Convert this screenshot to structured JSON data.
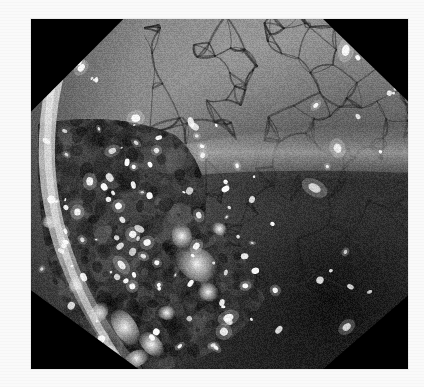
{
  "page": {
    "background_color": "#fafafa",
    "width": 424,
    "height": 387
  },
  "figure": {
    "name": "endoscopic-photograph",
    "alt_text": "Grayscale endoscopic photograph of mucosa with an irregular ulcerated nodular lesion on the left and a reticular vascular pattern on the right",
    "modality": "endoscopy",
    "color_mode": "grayscale",
    "frame": {
      "x": 31,
      "y": 19,
      "width": 377,
      "height": 350,
      "border_color": "#0a0a0a"
    },
    "corner_masks": [
      {
        "name": "top-left-mask",
        "corner": "top-left",
        "color": "#050505"
      },
      {
        "name": "top-right-mask",
        "corner": "top-right",
        "color": "#050505"
      },
      {
        "name": "bottom-left-mask",
        "corner": "bottom-left",
        "color": "#050505"
      },
      {
        "name": "bottom-right-mask",
        "corner": "bottom-right",
        "color": "#050505"
      }
    ],
    "regions": [
      {
        "name": "upper-right-mucosa",
        "description": "smooth pale mucosa with reticular vascular network",
        "tone": "mid-light"
      },
      {
        "name": "horizontal-fold",
        "description": "bright transverse mucosal fold across mid image",
        "tone": "light"
      },
      {
        "name": "left-lesion",
        "description": "irregular nodular ulcerated lesion with white specks",
        "tone": "dark-mottled"
      },
      {
        "name": "lower-right-lumen",
        "description": "dark shadowed lumen",
        "tone": "dark"
      },
      {
        "name": "left-rim-highlight",
        "description": "bright crescent light reflection along left and lower-left border",
        "tone": "bright"
      },
      {
        "name": "bottom-exudate",
        "description": "bright white exudate patches at lower-left",
        "tone": "bright"
      }
    ],
    "palette": {
      "black": "#050505",
      "deep_shadow": "#1d1d1d",
      "dark_tissue": "#3a3a3a",
      "mid_tissue": "#6e6e6e",
      "light_mucosa": "#9d9d9d",
      "pale_fold": "#bcbcbc",
      "highlight": "#ededed",
      "specular": "#ffffff",
      "paper": "#fafafa"
    },
    "specular_highlights_count": 140
  }
}
